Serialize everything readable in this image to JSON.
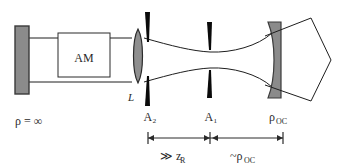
{
  "figure": {
    "name": "laser-resonator-schematic",
    "type": "optical-cavity-diagram",
    "width": 341,
    "height": 168,
    "background": "#ffffff"
  },
  "colors": {
    "mirror_fill": "#8b8b8b",
    "mirror_stroke": "#3a3a3a",
    "lens_fill": "#8f8f8f",
    "lens_stroke": "#2b2b2b",
    "aperture_fill": "#0a0a0a",
    "beam_stroke": "#1e1e1e",
    "box_fill": "#ffffff",
    "box_stroke": "#2b2b2b",
    "text": "#2a2a2a",
    "dimension_stroke": "#2a2a2a"
  },
  "components": {
    "end_mirror": {
      "label": "ρ = ∞",
      "name": "high-reflector-mirror",
      "x": 15,
      "y": 26,
      "width": 14,
      "height": 68
    },
    "gain_medium": {
      "label": "AM",
      "name": "active-medium-box",
      "x": 58,
      "y": 33,
      "width": 52,
      "height": 44
    },
    "lens": {
      "label": "L",
      "name": "intracavity-lens",
      "cx": 138,
      "cy": 56,
      "rx": 6,
      "ry": 27
    },
    "aperture_2": {
      "label": "A₂",
      "name": "aperture-a2",
      "x": 147,
      "label_x": 150,
      "label_y": 120
    },
    "aperture_1": {
      "label": "A₁",
      "name": "aperture-a1",
      "x": 209,
      "label_x": 211,
      "label_y": 120
    },
    "output_coupler": {
      "label": "ρ",
      "sublabel": "OC",
      "name": "output-coupler-mirror",
      "x": 268,
      "label_x": 272,
      "label_y": 120
    },
    "output_beam": {
      "name": "output-beam-cone"
    }
  },
  "dimensions": [
    {
      "name": "lens-to-a1-distance",
      "label": "≫ z",
      "sublabel": "R",
      "x_start": 148,
      "x_end": 210,
      "y": 138,
      "label_x": 166,
      "label_y": 157
    },
    {
      "name": "a1-to-oc-distance",
      "label": "~ρ",
      "sublabel": "OC",
      "x_start": 210,
      "x_end": 283,
      "y": 138,
      "label_x": 236,
      "label_y": 157
    }
  ],
  "labels": {
    "end_mirror_curvature": "ρ = ∞",
    "gain_medium": "AM",
    "lens": "L",
    "aperture_2": "A₂",
    "aperture_1": "A₁",
    "output_coupler_rho": "ρ",
    "output_coupler_sub": "OC",
    "dim1_main": "≫ z",
    "dim1_sub": "R",
    "dim2_main": "~ρ",
    "dim2_sub": "OC"
  }
}
